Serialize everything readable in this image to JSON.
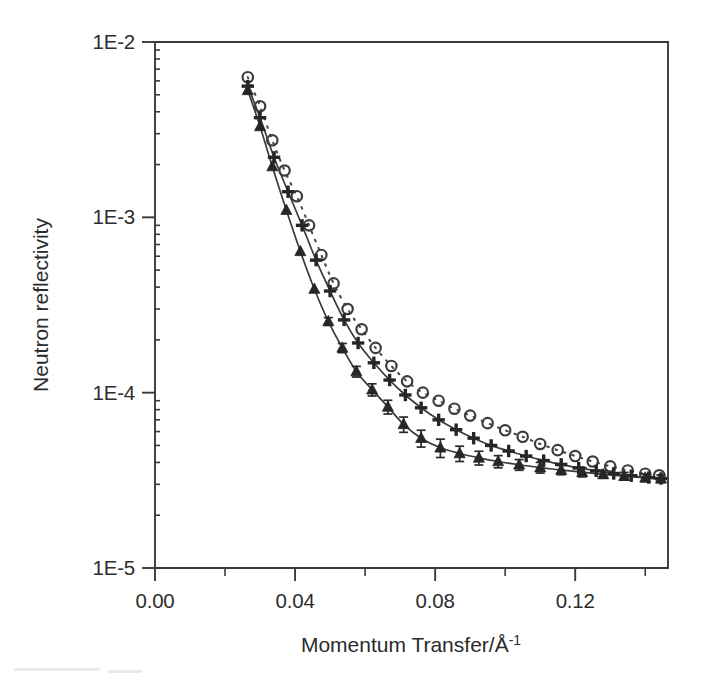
{
  "figure": {
    "background_color": "#ffffff",
    "ink_color": "#2b2b2b"
  },
  "chart_data": {
    "type": "scatter",
    "title": "",
    "subtitle": "",
    "xlabel": "Momentum Transfer/Å",
    "xlabel_superscript": "-1",
    "xlabel_full": "Momentum Transfer/Å-1",
    "ylabel": "Neutron reflectivity",
    "xscale": "linear",
    "yscale": "log",
    "xlim": [
      0.0,
      0.1465
    ],
    "ylim": [
      1e-05,
      0.01
    ],
    "grid": false,
    "legend_position": "none",
    "xticks": [
      0.0,
      0.04,
      0.08,
      0.12
    ],
    "xtick_labels": [
      "0.00",
      "0.04",
      "0.08",
      "0.12"
    ],
    "xminor_ticks": [
      0.02,
      0.06,
      0.1,
      0.14
    ],
    "yticks": [
      0.01,
      0.001,
      0.0001,
      1e-05
    ],
    "ytick_labels": [
      "1E-2",
      "1E-3",
      "1E-4",
      "1E-5"
    ],
    "series": [
      {
        "name": "open-circles",
        "marker": "open-circle",
        "line_style": "dotted",
        "color": "#3d3d3d",
        "has_error_bars": false,
        "x": [
          0.0265,
          0.03,
          0.0335,
          0.037,
          0.0405,
          0.044,
          0.0475,
          0.051,
          0.055,
          0.059,
          0.063,
          0.0675,
          0.072,
          0.0765,
          0.081,
          0.0855,
          0.09,
          0.095,
          0.1,
          0.105,
          0.11,
          0.115,
          0.12,
          0.125,
          0.13,
          0.135,
          0.14,
          0.144
        ],
        "y": [
          0.0063,
          0.0043,
          0.00275,
          0.00185,
          0.00132,
          0.0009,
          0.00061,
          0.00042,
          0.0003,
          0.00023,
          0.00018,
          0.000142,
          0.000116,
          0.0001,
          9e-05,
          8.1e-05,
          7.4e-05,
          6.7e-05,
          6.1e-05,
          5.6e-05,
          5.1e-05,
          4.7e-05,
          4.35e-05,
          4.05e-05,
          3.8e-05,
          3.6e-05,
          3.45e-05,
          3.38e-05
        ]
      },
      {
        "name": "plus-markers",
        "marker": "plus",
        "line_style": "solid",
        "color": "#262626",
        "has_error_bars": false,
        "x": [
          0.0265,
          0.03,
          0.034,
          0.038,
          0.042,
          0.046,
          0.05,
          0.054,
          0.058,
          0.0625,
          0.067,
          0.0715,
          0.076,
          0.081,
          0.086,
          0.091,
          0.096,
          0.101,
          0.106,
          0.111,
          0.116,
          0.121,
          0.126,
          0.131,
          0.136,
          0.141,
          0.1445
        ],
        "y": [
          0.0056,
          0.0037,
          0.0022,
          0.0014,
          0.0009,
          0.00057,
          0.00038,
          0.00026,
          0.000192,
          0.000148,
          0.000118,
          9.7e-05,
          8.2e-05,
          7e-05,
          6.15e-05,
          5.5e-05,
          5e-05,
          4.65e-05,
          4.35e-05,
          4.1e-05,
          3.9e-05,
          3.72e-05,
          3.58e-05,
          3.46e-05,
          3.36e-05,
          3.28e-05,
          3.24e-05
        ]
      },
      {
        "name": "filled-triangles",
        "marker": "filled-triangle",
        "line_style": "solid",
        "color": "#262626",
        "has_error_bars": true,
        "x": [
          0.0265,
          0.03,
          0.0335,
          0.0375,
          0.0415,
          0.0455,
          0.0495,
          0.0535,
          0.0575,
          0.062,
          0.0665,
          0.071,
          0.076,
          0.0815,
          0.087,
          0.0925,
          0.098,
          0.104,
          0.11,
          0.116,
          0.122,
          0.128,
          0.134,
          0.14,
          0.1445
        ],
        "y": [
          0.0053,
          0.0033,
          0.00195,
          0.0011,
          0.00064,
          0.00039,
          0.000255,
          0.00018,
          0.000132,
          0.000104,
          8.3e-05,
          6.6e-05,
          5.5e-05,
          4.85e-05,
          4.5e-05,
          4.25e-05,
          4.05e-05,
          3.88e-05,
          3.74e-05,
          3.62e-05,
          3.52e-05,
          3.42e-05,
          3.34e-05,
          3.27e-05,
          3.23e-05
        ],
        "yerr_rel": [
          0.0,
          0.0,
          0.0,
          0.0,
          0.0,
          0.0,
          0.05,
          0.06,
          0.07,
          0.08,
          0.09,
          0.1,
          0.11,
          0.12,
          0.1,
          0.09,
          0.08,
          0.07,
          0.07,
          0.06,
          0.06,
          0.05,
          0.05,
          0.05,
          0.05
        ]
      }
    ],
    "fit_curves": [
      {
        "name": "fit-upper-dotted",
        "style": "dotted",
        "follows_series": "open-circles"
      },
      {
        "name": "fit-middle-solid",
        "style": "solid",
        "follows_series": "plus-markers"
      },
      {
        "name": "fit-lower-solid",
        "style": "solid",
        "follows_series": "filled-triangles"
      }
    ]
  },
  "axes": {
    "x_axis_name": "momentum-transfer-axis",
    "y_axis_name": "neutron-reflectivity-axis"
  }
}
